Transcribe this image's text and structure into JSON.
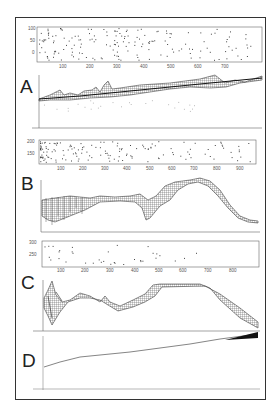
{
  "figure": {
    "panels": [
      {
        "label": "A"
      },
      {
        "label": "B"
      },
      {
        "label": "C"
      },
      {
        "label": "D"
      }
    ]
  },
  "chart_data": [
    {
      "panel": "A",
      "type": "scatter",
      "title": "",
      "xlabel": "",
      "ylabel": "",
      "x_ticks": [
        100,
        200,
        300,
        400,
        500,
        600,
        700
      ],
      "y_ticks": [
        0,
        50,
        100
      ],
      "xlim": [
        0,
        780
      ],
      "ylim": [
        -30,
        100
      ],
      "description": "Dense scatter of points, concentrated 0-400 and 600-720"
    },
    {
      "panel": "A",
      "type": "area",
      "title": "",
      "description": "Wireframe surface rising gradually left to right with ridges near x~150-250 and bulge near right end",
      "x_ticks_count": 10
    },
    {
      "panel": "B",
      "type": "scatter",
      "x_ticks": [
        100,
        200,
        300,
        400,
        500,
        600,
        700,
        800,
        900
      ],
      "y_ticks": [
        150,
        200
      ],
      "xlim": [
        0,
        980
      ],
      "ylim": [
        100,
        200
      ],
      "description": "Dense cluster 0-250, sparser to 900"
    },
    {
      "panel": "B",
      "type": "area",
      "description": "Wireframe surface: noisy left, dip near x~500, peak around x~700, descending to right"
    },
    {
      "panel": "C",
      "type": "scatter",
      "x_ticks": [
        100,
        200,
        300,
        400,
        500,
        600,
        700,
        800
      ],
      "y_ticks": [
        250,
        300
      ],
      "xlim": [
        20,
        900
      ],
      "ylim": [
        200,
        310
      ],
      "description": "Sparse points mostly x<500"
    },
    {
      "panel": "C",
      "type": "area",
      "description": "Wireframe surface: strong oscillation at left, plateau x~500-700, descending to right"
    },
    {
      "panel": "D",
      "type": "line",
      "description": "Nearly straight line increasing left to right, widening band at right end"
    }
  ]
}
